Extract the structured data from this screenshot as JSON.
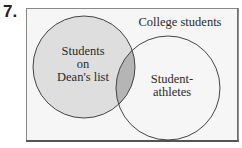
{
  "problem": {
    "number": "7."
  },
  "diagram": {
    "type": "venn",
    "universe": {
      "label": "College students"
    },
    "sets": [
      {
        "id": "deans-list",
        "label_lines": [
          "Students",
          "on",
          "Dean's list"
        ],
        "fill": "#dedede"
      },
      {
        "id": "student-athletes",
        "label_lines": [
          "Student-",
          "athletes"
        ],
        "fill": "none"
      }
    ],
    "intersection": {
      "fill": "#b5b5b5"
    },
    "colors": {
      "universe_fill": "#f6f6f6",
      "universe_border": "#555555",
      "circle_stroke": "#444444",
      "text": "#2a2a2a"
    }
  }
}
